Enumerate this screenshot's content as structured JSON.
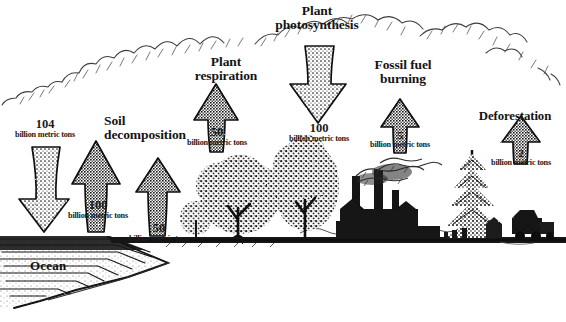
{
  "diagram": {
    "style": "hand-drawn pen-and-ink illustration, black on white",
    "unit_text": "billion\nmetric tons",
    "ocean_label": "Ocean",
    "ink_color": "#161616",
    "background_color": "#ffffff"
  },
  "flows": [
    {
      "id": "ocean-absorption",
      "label": "",
      "amount": "104",
      "unit": "billion\nmetric tons",
      "direction": "down",
      "target": "ocean"
    },
    {
      "id": "ocean-release",
      "label": "",
      "amount": "100",
      "unit": "billion\nmetric tons",
      "direction": "up",
      "target": "atmosphere"
    },
    {
      "id": "soil-decomposition",
      "label": "Soil\ndecomposition",
      "amount": "50",
      "unit": "billion\nmetric tons",
      "direction": "up",
      "target": "atmosphere"
    },
    {
      "id": "plant-respiration",
      "label": "Plant\nrespiration",
      "amount": "50",
      "unit": "billion\nmetric tons",
      "direction": "up",
      "target": "atmosphere"
    },
    {
      "id": "plant-photosynthesis",
      "label": "Plant\nphotosynthesis",
      "amount": "100",
      "unit": "billion\nmetric tons",
      "direction": "down",
      "target": "vegetation"
    },
    {
      "id": "fossil-fuel-burning",
      "label": "Fossil fuel\nburning",
      "amount": "5",
      "unit": "billion\nmetric tons",
      "direction": "up",
      "target": "atmosphere"
    },
    {
      "id": "deforestation",
      "label": "Deforestation",
      "amount": "2",
      "unit": "billion\nmetric tons",
      "direction": "up",
      "target": "atmosphere"
    }
  ],
  "scenery": [
    {
      "id": "clouds",
      "name": "cloud band across sky"
    },
    {
      "id": "ocean",
      "name": "ocean with wave lines and sloping shoreline"
    },
    {
      "id": "trees",
      "name": "two broadleaf deciduous trees"
    },
    {
      "id": "factory",
      "name": "factory silhouette with three smokestacks emitting smoke"
    },
    {
      "id": "conifer",
      "name": "tall conifer tree"
    },
    {
      "id": "hills",
      "name": "distant hills on horizon"
    },
    {
      "id": "logging-truck",
      "name": "logging vehicle and cut stumps"
    }
  ]
}
